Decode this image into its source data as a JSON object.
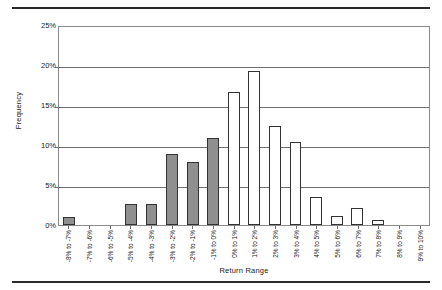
{
  "chart_data": {
    "type": "bar",
    "title": "",
    "xlabel": "Return Range",
    "ylabel": "Frequency",
    "ylim": [
      0,
      25
    ],
    "ytick_labels": [
      "25%",
      "20%",
      "15%",
      "10%",
      "5%",
      "0%"
    ],
    "ytick_values": [
      25,
      20,
      15,
      10,
      5,
      0
    ],
    "grid": true,
    "legend": "none",
    "categories": [
      "-8% to -7%",
      "-7% to -6%",
      "-6% to -5%",
      "-5% to -4%",
      "-4% to -3%",
      "-3% to -2%",
      "-2% to -1%",
      "-1% to 0%",
      "0% to 1%",
      "1% to 2%",
      "2% to 3%",
      "3% to 4%",
      "4% to 5%",
      "5% to 6%",
      "6% to 7%",
      "7% to 8%",
      "8% to 9%",
      "9% to 10%"
    ],
    "values": [
      1.0,
      0.0,
      0.0,
      2.7,
      2.7,
      9.0,
      8.0,
      11.0,
      16.8,
      19.5,
      12.5,
      10.5,
      3.6,
      1.1,
      2.1,
      0.6,
      0.0,
      0.0
    ],
    "bar_styles": [
      "filled",
      "filled",
      "filled",
      "filled",
      "filled",
      "filled",
      "filled",
      "filled",
      "hollow",
      "hollow",
      "hollow",
      "hollow",
      "hollow",
      "hollow",
      "hollow",
      "hollow",
      "hollow",
      "hollow"
    ],
    "colors": {
      "filled_bar": "#8f8f8f",
      "hollow_bar": "#ffffff",
      "bar_outline": "#333333",
      "gridline": "#6e6e6e",
      "plot_border": "#8a8a8a",
      "page_rule": "#2b2b2b",
      "text": "#1a1a1a"
    }
  }
}
